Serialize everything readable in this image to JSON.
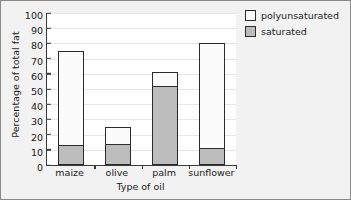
{
  "chart_data": {
    "type": "bar",
    "subtype": "stacked-bar",
    "title": "",
    "xlabel": "Type of oil",
    "ylabel": "Percentage of total fat",
    "categories": [
      "maize",
      "olive",
      "palm",
      "sunflower"
    ],
    "series": [
      {
        "name": "saturated",
        "values": [
          13,
          14,
          52,
          11
        ],
        "color": "#bcbcbc"
      },
      {
        "name": "polyunsaturated",
        "values": [
          62,
          11,
          9,
          69
        ],
        "color": "#fbfbfb"
      }
    ],
    "stack_totals": [
      75,
      25,
      61,
      80
    ],
    "ylim": [
      0,
      100
    ],
    "yticks": [
      0,
      10,
      20,
      30,
      40,
      50,
      60,
      70,
      80,
      90,
      100
    ],
    "ytick_labels": [
      "0",
      "10",
      "20",
      "30",
      "40",
      "50",
      "60",
      "70",
      "80",
      "90",
      "100"
    ],
    "grid": true,
    "legend_position": "top-right",
    "legend_entries": [
      "polyunsaturated",
      "saturated"
    ]
  },
  "legend": {
    "items": [
      {
        "label": "polyunsaturated",
        "swatch": "white"
      },
      {
        "label": "saturated",
        "swatch": "gray"
      }
    ]
  },
  "axes": {
    "y_title": "Percentage of total fat",
    "x_title": "Type of oil"
  }
}
